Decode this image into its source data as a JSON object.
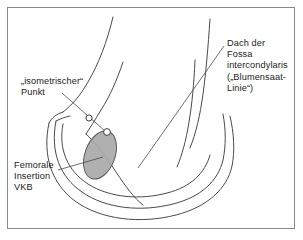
{
  "figure": {
    "kind": "anatomical-line-drawing",
    "background_color": "#ffffff",
    "frame_color": "#8a8a8a",
    "line_color": "#4a4a4a",
    "text_color": "#1b1b1b",
    "marker_fill": "#ffffff",
    "marker_stroke": "#3c3c3c",
    "insertion_fill": "#a9a9a9",
    "insertion_stroke": "#5a5a5a"
  },
  "labels": {
    "isometric_point": {
      "lines": [
        "„isometrischer“",
        "Punkt"
      ],
      "text": "„isometrischer“\nPunkt"
    },
    "femoral_insertion": {
      "lines": [
        "Femorale",
        "Insertion",
        "VKB"
      ],
      "text": "Femorale\nInsertion\nVKB"
    },
    "notch_roof": {
      "lines": [
        "Dach der",
        "Fossa",
        "intercondylaris",
        "(„Blumensaat-",
        "Linie“)"
      ],
      "text": "Dach der\nFossa\nintercondylaris\n(„Blumensaat-\nLinie“)"
    }
  },
  "markers": [
    {
      "name": "isometric-point-upper",
      "cx": 89,
      "cy": 118,
      "r": 3.1
    },
    {
      "name": "isometric-point-lower",
      "cx": 107,
      "cy": 132,
      "r": 3.4
    }
  ],
  "leader_lines": [
    {
      "name": "isometric-leader",
      "from": [
        62,
        93
      ],
      "to": [
        105,
        131
      ]
    },
    {
      "name": "femoral-leader",
      "from": [
        58,
        170
      ],
      "to": [
        103,
        157
      ]
    },
    {
      "name": "roof-leader",
      "from": [
        224,
        46
      ],
      "to": [
        138,
        168
      ]
    }
  ],
  "insertion_ellipse": {
    "name": "femoral-acl-insertion",
    "cx": 100,
    "cy": 155,
    "rx": 15,
    "ry": 25,
    "rotation_deg": 20
  }
}
